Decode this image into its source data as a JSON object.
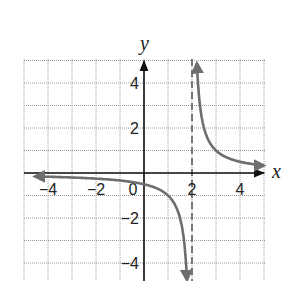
{
  "chart_data": {
    "type": "line",
    "title": "",
    "xlabel": "x",
    "ylabel": "y",
    "xlim": [
      -4.5,
      5
    ],
    "ylim": [
      -4.8,
      5
    ],
    "grid": true,
    "grid_style": "dotted",
    "x_ticks": [
      -4,
      -2,
      0,
      2,
      4
    ],
    "y_ticks": [
      -4,
      -2,
      2,
      4
    ],
    "x_tick_labels": [
      "−4",
      "−2",
      "0",
      "2",
      "4"
    ],
    "y_tick_labels": [
      "−4",
      "−2",
      "2",
      "4"
    ],
    "function": "y = 1/(x - 2)",
    "vertical_asymptote": {
      "x": 2,
      "style": "dashed"
    },
    "horizontal_asymptote": {
      "y": 0
    },
    "series": [
      {
        "name": "left branch",
        "x": [
          -4.5,
          -4,
          -3,
          -2,
          -1,
          0,
          1,
          1.5,
          1.75,
          1.8
        ],
        "y": [
          -0.15,
          -0.17,
          -0.2,
          -0.25,
          -0.33,
          -0.5,
          -1,
          -2,
          -4,
          -5
        ]
      },
      {
        "name": "right branch",
        "x": [
          2.2,
          2.25,
          2.5,
          3,
          4,
          5
        ],
        "y": [
          5,
          4,
          2,
          1,
          0.5,
          0.33
        ]
      }
    ],
    "colors": {
      "curve": "#6e6e6e",
      "axes": "#111111",
      "grid": "#9a9a9a",
      "asymptote": "#777777"
    }
  }
}
